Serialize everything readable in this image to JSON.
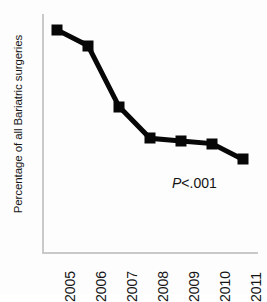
{
  "chart_data": {
    "type": "line",
    "title": "",
    "xlabel": "",
    "ylabel": "Percentage of all Bariatric surgeries",
    "categories": [
      "2005",
      "2006",
      "2007",
      "2008",
      "2009",
      "2010",
      "2011"
    ],
    "values": [
      8.4,
      7.8,
      5.5,
      4.3,
      4.2,
      4.1,
      3.5
    ],
    "series": [
      {
        "name": "Percentage of all Bariatric surgeries",
        "values": [
          8.4,
          7.8,
          5.5,
          4.3,
          4.2,
          4.1,
          3.5
        ]
      }
    ],
    "ylim": [
      0,
      9
    ],
    "yticks": [
      0,
      1,
      2,
      3,
      4,
      5,
      6,
      7,
      8,
      9
    ],
    "ytick_labels": [
      "0",
      "1",
      "2",
      "3",
      "4",
      "5",
      "6",
      "7",
      "8",
      "9"
    ],
    "xtick_labels": [
      "2005",
      "2006",
      "2007",
      "2008",
      "2009",
      "2010",
      "2011"
    ],
    "xtick_rotation": 90,
    "grid": false,
    "legend": false,
    "legend_position": "none",
    "marker": "square",
    "marker_color": "#070707",
    "line_color": "#070707",
    "axis_color": "#c9c9c9",
    "annotations": [
      {
        "name": "p-value",
        "text": "P<.001",
        "p_italic": "P",
        "p_rest": "<.001",
        "x_category": "2010",
        "y_value": 2.6
      }
    ]
  },
  "axis": {
    "y_title": "Percentage of all Bariatric surgeries"
  }
}
